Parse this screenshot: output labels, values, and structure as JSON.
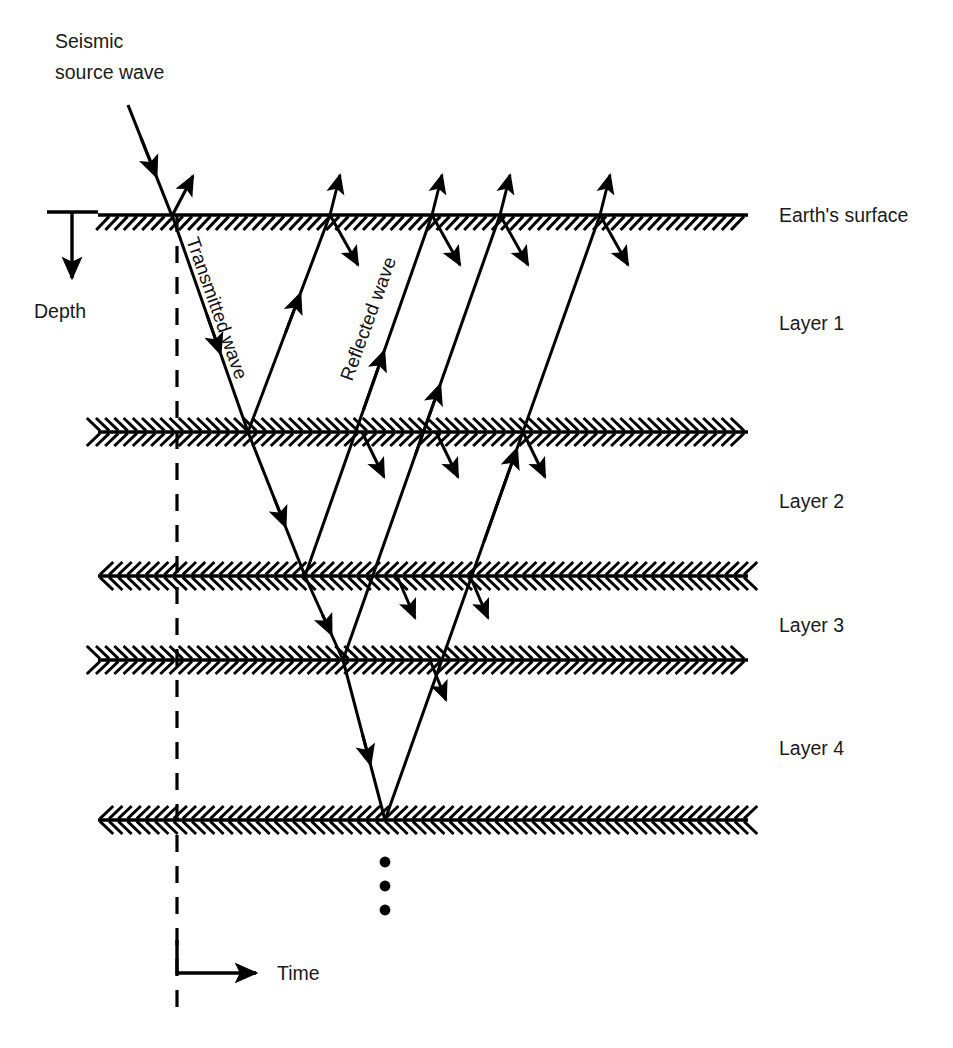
{
  "figure": {
    "title_text": "Seismic reflection ray-path diagram",
    "background_color": "#ffffff",
    "ink_color": "#000000"
  },
  "annotations": {
    "source_label_line1": "Seismic",
    "source_label_line2": "source wave",
    "transmitted_label": "Transmitted wave",
    "reflected_label": "Reflected wave",
    "depth_axis_label": "Depth",
    "time_axis_label": "Time"
  },
  "interfaces": [
    {
      "name": "Earth's surface",
      "label": "Earth's surface",
      "y": 215,
      "hatch": "below-only"
    },
    {
      "name": "interface-1",
      "label": "",
      "y": 432,
      "hatch": "both"
    },
    {
      "name": "interface-2",
      "label": "",
      "y": 576,
      "hatch": "both"
    },
    {
      "name": "interface-3",
      "label": "",
      "y": 660,
      "hatch": "both"
    },
    {
      "name": "interface-4",
      "label": "",
      "y": 820,
      "hatch": "both"
    }
  ],
  "layers": [
    {
      "label": "Layer 1",
      "y": 330
    },
    {
      "label": "Layer 2",
      "y": 508
    },
    {
      "label": "Layer 3",
      "y": 632
    },
    {
      "label": "Layer 4",
      "y": 755
    }
  ],
  "geometry": {
    "left_edge": 98,
    "right_edge": 748,
    "source_x": 172,
    "surface_y": 215,
    "dashed_line_x": 177,
    "dashed_top": 215,
    "dashed_bottom": 1012,
    "bottom_apex_x": 385,
    "surface_bounce_points": [
      330,
      432,
      500,
      600
    ],
    "ellipsis_dots": [
      [
        385,
        862
      ],
      [
        385,
        886
      ],
      [
        385,
        910
      ]
    ]
  },
  "chart_data": {
    "type": "diagram",
    "rays": [
      {
        "name": "source-downgoing",
        "from": [
          128,
          105
        ],
        "to": [
          172,
          215
        ],
        "arrow": "mid-down"
      },
      {
        "name": "surface-reflection-up",
        "from": [
          172,
          215
        ],
        "to": [
          192,
          178
        ],
        "arrow": "end-up"
      },
      {
        "name": "transmitted-leg-1",
        "from": [
          172,
          215
        ],
        "to": [
          248,
          432
        ],
        "arrow": "mid-down"
      },
      {
        "name": "reflected-leg-1-up",
        "from": [
          248,
          432
        ],
        "to": [
          330,
          215
        ],
        "arrow": "mid-up"
      },
      {
        "name": "transmitted-leg-2",
        "from": [
          248,
          432
        ],
        "to": [
          305,
          576
        ],
        "arrow": "mid-down"
      },
      {
        "name": "reflected-leg-2-up",
        "from": [
          305,
          576
        ],
        "to": [
          432,
          215
        ],
        "arrow": "mid-up"
      },
      {
        "name": "transmitted-leg-3",
        "from": [
          305,
          576
        ],
        "to": [
          343,
          660
        ],
        "arrow": "mid-down"
      },
      {
        "name": "reflected-leg-3-up",
        "from": [
          343,
          660
        ],
        "to": [
          500,
          215
        ],
        "arrow": "mid-up"
      },
      {
        "name": "transmitted-leg-4",
        "from": [
          343,
          660
        ],
        "to": [
          385,
          820
        ],
        "arrow": "mid-down"
      },
      {
        "name": "reflected-leg-4-up",
        "from": [
          385,
          820
        ],
        "to": [
          600,
          215
        ],
        "arrow": "mid-up"
      }
    ],
    "secondary_downgoing": [
      {
        "name": "stub-surface-b1",
        "at": [
          330,
          215
        ],
        "dx": 28,
        "dy": 50
      },
      {
        "name": "stub-surface-b2",
        "at": [
          432,
          215
        ],
        "dx": 28,
        "dy": 50
      },
      {
        "name": "stub-surface-b3",
        "at": [
          500,
          215
        ],
        "dx": 28,
        "dy": 50
      },
      {
        "name": "stub-surface-b4",
        "at": [
          600,
          215
        ],
        "dx": 28,
        "dy": 50
      },
      {
        "name": "stub-iface1-b1",
        "at": [
          362,
          432
        ],
        "dx": 22,
        "dy": 45
      },
      {
        "name": "stub-iface1-b2",
        "at": [
          436,
          432
        ],
        "dx": 22,
        "dy": 45
      },
      {
        "name": "stub-iface1-b3",
        "at": [
          523,
          432
        ],
        "dx": 22,
        "dy": 45
      },
      {
        "name": "stub-iface2-b1",
        "at": [
          397,
          576
        ],
        "dx": 18,
        "dy": 42
      },
      {
        "name": "stub-iface2-b2",
        "at": [
          470,
          576
        ],
        "dx": 18,
        "dy": 42
      },
      {
        "name": "stub-iface3-b1",
        "at": [
          430,
          660
        ],
        "dx": 16,
        "dy": 40
      }
    ],
    "upgoing_surface_arrows": [
      {
        "name": "up-arrow-1",
        "at": [
          330,
          215
        ],
        "dx": 10,
        "dy": -40
      },
      {
        "name": "up-arrow-2",
        "at": [
          432,
          215
        ],
        "dx": 10,
        "dy": -40
      },
      {
        "name": "up-arrow-3",
        "at": [
          500,
          215
        ],
        "dx": 10,
        "dy": -40
      },
      {
        "name": "up-arrow-4",
        "at": [
          600,
          215
        ],
        "dx": 10,
        "dy": -40
      }
    ]
  }
}
